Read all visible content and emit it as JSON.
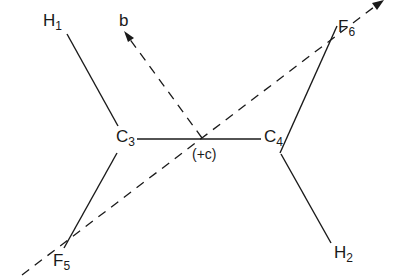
{
  "diagram": {
    "type": "molecular-geometry",
    "atoms": [
      {
        "id": "H1",
        "symbol": "H",
        "subscript": "1"
      },
      {
        "id": "C3",
        "symbol": "C",
        "subscript": "3"
      },
      {
        "id": "C4",
        "symbol": "C",
        "subscript": "4"
      },
      {
        "id": "F5",
        "symbol": "F",
        "subscript": "5"
      },
      {
        "id": "F6",
        "symbol": "F",
        "subscript": "6"
      },
      {
        "id": "H2",
        "symbol": "H",
        "subscript": "2"
      }
    ],
    "bonds": [
      [
        "H1",
        "C3"
      ],
      [
        "C3",
        "C4"
      ],
      [
        "C3",
        "F5"
      ],
      [
        "C4",
        "F6"
      ],
      [
        "C4",
        "H2"
      ]
    ],
    "axes": [
      {
        "id": "b",
        "label": "b",
        "style": "dashed",
        "arrow": true
      },
      {
        "id": "F-F axis",
        "label": "",
        "style": "dashed",
        "arrow": true
      }
    ],
    "center_label": "(+c)",
    "stroke_color": "#1a1a1a",
    "background": "#ffffff"
  }
}
